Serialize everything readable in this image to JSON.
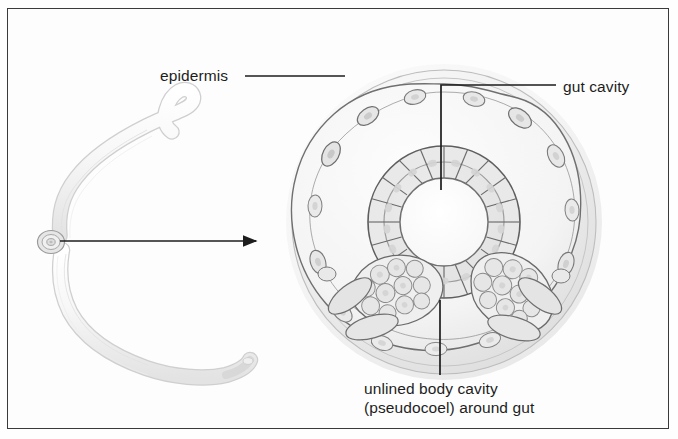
{
  "figure": {
    "background_color": "#fdfdfd",
    "frame_color": "#3a3a3a",
    "ink_color": "#1d1d1d"
  },
  "labels": {
    "epidermis": "epidermis",
    "gut_cavity": "gut cavity",
    "pseudocoel_line1": "unlined body cavity",
    "pseudocoel_line2": "(pseudocoel) around gut"
  },
  "illustration": {
    "worm": {
      "name": "whole-nematode-worm",
      "description": "pale curved roundworm, hooked anterior tip upper right, tapering posterior tip lower right"
    },
    "cross_section": {
      "name": "nematode-cross-section",
      "center_x": 444,
      "center_y": 222,
      "outer_radius": 158,
      "cuticle_radius": 150,
      "epidermis_radius": 139,
      "gut_outer_radius": 74,
      "gut_inner_radius": 44,
      "gut_cell_count": 20,
      "muscle_cell_count": 16,
      "gonad_masses": 2
    },
    "magnifier_arrow": {
      "name": "magnification-arrow",
      "from_x": 58,
      "from_y": 241,
      "to_x": 258,
      "to_y": 241
    }
  },
  "leaders": {
    "epidermis": {
      "x1": 245,
      "y1": 76,
      "x2": 345,
      "y2": 76
    },
    "gut_cavity": {
      "x1": 556,
      "y1": 85,
      "x2": 441,
      "y2": 85,
      "x3": 441,
      "y3": 190
    },
    "pseudocoel": {
      "x1": 440,
      "y1": 300,
      "x2": 440,
      "y2": 375
    }
  }
}
